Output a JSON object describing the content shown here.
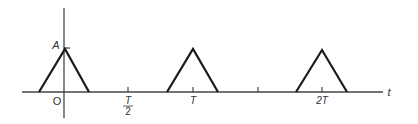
{
  "diagram": {
    "type": "periodic-triangular-pulse-train",
    "axis_labels": {
      "vertical_value": "A",
      "origin": "O",
      "horizontal": "t"
    },
    "ticks": [
      {
        "label_num": "T",
        "label_den": "2",
        "position": "T/2"
      },
      {
        "label": "T",
        "position": "T"
      },
      {
        "label": "",
        "position": "3T/2"
      },
      {
        "label": "2T",
        "position": "2T"
      }
    ],
    "pulses": [
      {
        "center": "0",
        "amplitude": "A"
      },
      {
        "center": "T",
        "amplitude": "A"
      },
      {
        "center": "2T",
        "amplitude": "A"
      }
    ],
    "colors": {
      "line": "#1a1a1a",
      "axis": "#444444",
      "text": "#333333"
    }
  }
}
